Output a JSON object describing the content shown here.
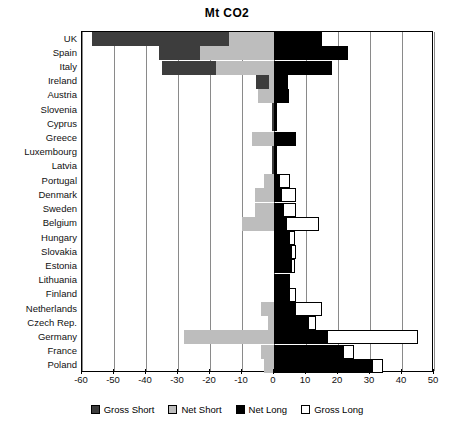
{
  "chart_data": {
    "type": "bar",
    "orientation": "horizontal",
    "title": "Mt CO2",
    "xlabel": "",
    "ylabel": "",
    "xlim": [
      -60,
      50
    ],
    "xticks": [
      -60,
      -50,
      -40,
      -30,
      -20,
      -10,
      0,
      10,
      20,
      30,
      40,
      50
    ],
    "grid": true,
    "legend_position": "bottom",
    "categories": [
      "UK",
      "Spain",
      "Italy",
      "Ireland",
      "Austria",
      "Slovenia",
      "Cyprus",
      "Greece",
      "Luxembourg",
      "Latvia",
      "Portugal",
      "Denmark",
      "Sweden",
      "Belgium",
      "Hungary",
      "Slovakia",
      "Estonia",
      "Lithuania",
      "Finland",
      "Netherlands",
      "Czech Rep.",
      "Germany",
      "France",
      "Poland"
    ],
    "series": [
      {
        "name": "Gross Short",
        "color": "#3d3d3d",
        "values": [
          -57.0,
          -36.0,
          -35.0,
          -5.6,
          0.0,
          -0.6,
          -0.6,
          0.0,
          -0.6,
          -0.6,
          0.0,
          0.0,
          0.0,
          0.0,
          0.0,
          0.0,
          0.0,
          0.0,
          0.0,
          0.0,
          0.0,
          0.0,
          0.0,
          0.0
        ]
      },
      {
        "name": "Net Short",
        "color": "#bdbdbd",
        "values": [
          -14.0,
          -23.0,
          -18.0,
          -1.5,
          -5.0,
          0.0,
          0.0,
          -7.0,
          0.0,
          0.0,
          -3.0,
          -6.0,
          -6.0,
          -10.0,
          0.0,
          0.0,
          0.0,
          0.0,
          0.0,
          -4.0,
          -2.0,
          -28.0,
          -4.0,
          -3.0
        ]
      },
      {
        "name": "Net Long",
        "color": "#000000",
        "values": [
          15.0,
          23.0,
          18.0,
          4.4,
          4.7,
          0.8,
          0.8,
          7.0,
          0.8,
          0.8,
          2.0,
          2.5,
          3.0,
          4.0,
          5.0,
          5.5,
          5.5,
          5.0,
          5.0,
          7.0,
          11.0,
          17.0,
          22.0,
          31.0
        ]
      },
      {
        "name": "Gross Long",
        "color": "#ffffff",
        "values": [
          15.0,
          23.0,
          18.0,
          4.4,
          4.7,
          0.8,
          0.8,
          7.0,
          0.8,
          0.8,
          5.0,
          7.0,
          7.0,
          14.0,
          6.5,
          7.0,
          6.5,
          5.0,
          7.0,
          15.0,
          13.0,
          45.0,
          25.0,
          34.0
        ]
      }
    ]
  },
  "legend": {
    "items": [
      {
        "label": "Gross Short",
        "color": "#3d3d3d"
      },
      {
        "label": "Net Short",
        "color": "#bdbdbd"
      },
      {
        "label": "Net Long",
        "color": "#000000"
      },
      {
        "label": "Gross Long",
        "color": "#ffffff"
      }
    ]
  }
}
